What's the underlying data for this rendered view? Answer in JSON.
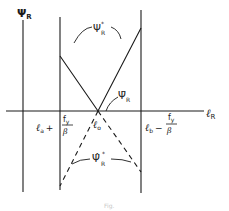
{
  "diagram": {
    "axes": {
      "y_label_symbol": "Ψ",
      "y_label_sub": "R",
      "x_label_symbol": "ℓ",
      "x_label_sub": "R"
    },
    "vertical_lines": {
      "left_label_prefix": "ℓ",
      "left_label_sub": "a",
      "left_label_op": "+",
      "right_label_prefix": "ℓ",
      "right_label_sub": "b",
      "right_label_op": "−",
      "frac_num": "f",
      "frac_num_sub": "y",
      "frac_den": "β"
    },
    "center": {
      "label_symbol": "ℓ",
      "label_sub": "o"
    },
    "curves": {
      "upper_label_symbol": "Ψ",
      "upper_label_sub": "R",
      "upper_label_sup": "*",
      "bar_label_symbol": "Ψ̄",
      "bar_label_sub": "R",
      "lower_label_symbol": "Ψ̂",
      "lower_label_sub": "R",
      "lower_label_sup": "*"
    },
    "caption": "Fig."
  },
  "colors": {
    "ink": "#1a1a1a",
    "background": "#ffffff"
  }
}
